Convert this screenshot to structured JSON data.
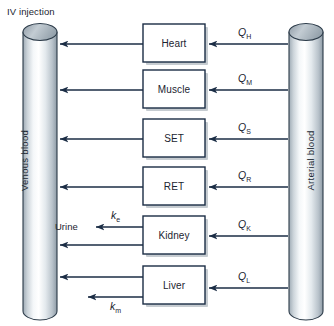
{
  "diagram": {
    "title": "IV injection",
    "type": "pbpk-flow-diagram",
    "colors": {
      "line": "#1b2d45",
      "box_fill": "#ffffff",
      "box_stroke": "#1b2d45",
      "cylinder_light": "#ffffff",
      "cylinder_mid": "#d6dde3",
      "cylinder_dark": "#97a4ae",
      "cylinder_top": "#aeb9c2",
      "text": "#1b2430",
      "background": "#ffffff",
      "shadow": "#bcc3c9"
    },
    "left_compartment": {
      "name": "Venous blood",
      "label": "Venous blood"
    },
    "right_compartment": {
      "name": "Arterial blood",
      "label": "Arterial blood"
    },
    "organs": [
      {
        "label": "Heart",
        "flow_symbol": "Q",
        "flow_subscript": "H"
      },
      {
        "label": "Muscle",
        "flow_symbol": "Q",
        "flow_subscript": "M"
      },
      {
        "label": "SET",
        "flow_symbol": "Q",
        "flow_subscript": "S"
      },
      {
        "label": "RET",
        "flow_symbol": "Q",
        "flow_subscript": "R"
      },
      {
        "label": "Kidney",
        "flow_symbol": "Q",
        "flow_subscript": "K"
      },
      {
        "label": "Liver",
        "flow_symbol": "Q",
        "flow_subscript": "L"
      }
    ],
    "elimination": [
      {
        "target": "Urine",
        "label": "Urine",
        "rate_symbol": "k",
        "rate_subscript": "e",
        "from_organ": "Kidney"
      },
      {
        "target": "Metabolism",
        "label": "",
        "rate_symbol": "k",
        "rate_subscript": "m",
        "from_organ": "Liver"
      }
    ]
  }
}
